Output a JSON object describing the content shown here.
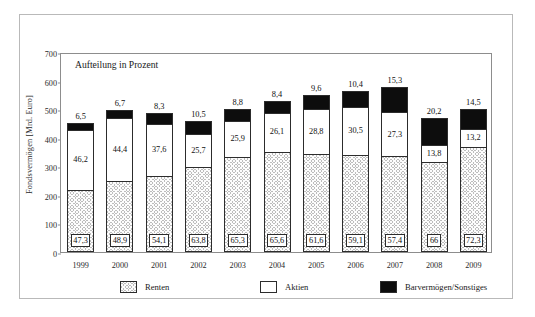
{
  "chart_data": {
    "type": "bar",
    "subtype": "stacked-bar-percent-labels",
    "title": "Aufteilung in Prozent",
    "xlabel": "",
    "ylabel": "Fondsvermögen [Mrd. Euro]",
    "ylim": [
      0,
      700
    ],
    "yticks": [
      0,
      100,
      200,
      300,
      400,
      500,
      600,
      700
    ],
    "grid": false,
    "legend_position": "bottom",
    "categories": [
      "1999",
      "2000",
      "2001",
      "2002",
      "2003",
      "2004",
      "2005",
      "2006",
      "2007",
      "2008",
      "2009"
    ],
    "totals": [
      460,
      505,
      492,
      466,
      508,
      536,
      556,
      572,
      583,
      475,
      509
    ],
    "series": [
      {
        "name": "Renten",
        "fill": "hatched",
        "values": [
          47.3,
          48.9,
          54.1,
          63.8,
          65.3,
          65.6,
          61.6,
          59.1,
          57.4,
          66.0,
          72.3
        ]
      },
      {
        "name": "Aktien",
        "fill": "white",
        "values": [
          46.2,
          44.4,
          37.6,
          25.7,
          25.9,
          26.1,
          28.8,
          30.5,
          27.3,
          13.8,
          13.2
        ]
      },
      {
        "name": "Barvermögen/Sonstiges",
        "fill": "black",
        "values": [
          6.5,
          6.7,
          8.3,
          10.5,
          8.8,
          8.4,
          9.6,
          10.4,
          15.3,
          20.2,
          14.5
        ]
      }
    ],
    "legend": [
      {
        "label": "Renten",
        "swatch": "hatched"
      },
      {
        "label": "Aktien",
        "swatch": "white"
      },
      {
        "label": "Barvermögen/Sonstiges",
        "swatch": "black"
      }
    ],
    "colors": {
      "hatched": "#bdbdbd",
      "white": "#ffffff",
      "black": "#0d0d0d",
      "axis": "#8d8d8d",
      "frame": "#b9b9b9",
      "text": "#1a1a1a"
    }
  }
}
